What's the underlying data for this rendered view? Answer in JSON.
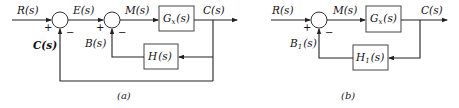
{
  "diagrams": [
    {
      "id": "a",
      "caption": "(a)",
      "signals": {
        "input": "R(s)",
        "error": "E(s)",
        "intermediate": "M(s)",
        "output": "C(s)",
        "outer_feedback": "C(s)",
        "inner_feedback": "B(s)"
      },
      "blocks": {
        "forward": {
          "name": "G",
          "sub": "x",
          "arg": "(s)"
        },
        "feedback": {
          "name": "H",
          "sub": "",
          "arg": "(s)"
        }
      },
      "junctions": [
        {
          "plus": "+",
          "minus": "−"
        },
        {
          "plus": "+",
          "minus": "−"
        }
      ]
    },
    {
      "id": "b",
      "caption": "(b)",
      "signals": {
        "input": "R(s)",
        "intermediate": "M(s)",
        "output": "C(s)",
        "feedback_name": "B",
        "feedback_sub": "1",
        "feedback_arg": "(s)"
      },
      "blocks": {
        "forward": {
          "name": "G",
          "sub": "x",
          "arg": "(s)"
        },
        "feedback": {
          "name": "H",
          "sub": "1",
          "arg": "(s)"
        }
      },
      "junctions": [
        {
          "plus": "+",
          "minus": "−"
        }
      ]
    }
  ],
  "colors": {
    "line": "#222222",
    "box": "#444444",
    "background": "#ffffff"
  }
}
